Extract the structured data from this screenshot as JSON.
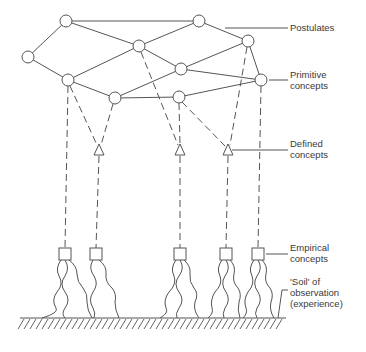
{
  "diagram": {
    "labels": {
      "postulates": "Postulates",
      "primitive_line1": "Primitive",
      "primitive_line2": "concepts",
      "defined_line1": "Defined",
      "defined_line2": "concepts",
      "empirical_line1": "Empirical",
      "empirical_line2": "concepts",
      "soil_line1": "'Soil' of",
      "soil_line2": "observation",
      "soil_line3": "(experience)"
    },
    "nodes": [
      {
        "id": "A",
        "x": 66,
        "y": 21
      },
      {
        "id": "B",
        "x": 28,
        "y": 57
      },
      {
        "id": "C",
        "x": 68,
        "y": 80
      },
      {
        "id": "D",
        "x": 139,
        "y": 46
      },
      {
        "id": "E",
        "x": 115,
        "y": 98
      },
      {
        "id": "F",
        "x": 199,
        "y": 21
      },
      {
        "id": "G",
        "x": 181,
        "y": 69
      },
      {
        "id": "H",
        "x": 248,
        "y": 41
      },
      {
        "id": "I",
        "x": 179,
        "y": 97
      },
      {
        "id": "J",
        "x": 261,
        "y": 80
      }
    ],
    "defined_concepts": [
      {
        "x": 99,
        "y": 150
      },
      {
        "x": 180,
        "y": 150
      },
      {
        "x": 228,
        "y": 150
      }
    ],
    "empirical_concepts": [
      {
        "x": 65,
        "y": 254
      },
      {
        "x": 96,
        "y": 254
      },
      {
        "x": 180,
        "y": 254
      },
      {
        "x": 226,
        "y": 254
      },
      {
        "x": 258,
        "y": 254
      }
    ],
    "colors": {
      "stroke": "#555555",
      "text": "#3a3a3a"
    }
  }
}
